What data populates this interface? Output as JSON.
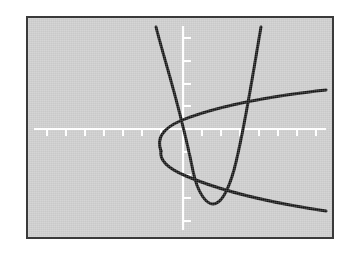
{
  "figure": {
    "kind": "graphing-calculator-plot",
    "background_color": "#c9c9c9",
    "border_color": "#3a3a3a",
    "axis_color": "#ffffff",
    "curve_color": "#141414",
    "curve_width": 3.0,
    "axis_width": 2.0,
    "tick_length": 7,
    "frame": {
      "x": 26,
      "y": 16,
      "width": 308,
      "height": 223
    }
  },
  "chart_data": {
    "type": "line",
    "title": "",
    "subtitle": "",
    "xlabel": "",
    "ylabel": "",
    "grid": false,
    "legend_position": "none",
    "axes": {
      "x_axis_pixel_y": 111,
      "y_axis_pixel_x": 155,
      "x_axis_visible": true,
      "y_axis_visible": true,
      "xlim": [
        -8.2,
        8.2
      ],
      "ylim": [
        -5.9,
        5.9
      ],
      "x_tick_spacing": 1,
      "y_tick_spacing": 1,
      "tick_labels_visible": false,
      "x_tick_pixels": [
        19,
        38,
        57,
        76,
        95,
        114,
        133,
        155,
        174,
        193,
        212,
        231,
        250,
        269,
        288
      ],
      "y_tick_pixels": [
        20,
        43,
        66,
        88,
        134,
        157,
        180,
        203
      ]
    },
    "series": [
      {
        "name": "upward-parabola",
        "type": "line",
        "shape": "parabola-opening-up",
        "color": "#141414",
        "vertex": {
          "x": 1.3,
          "y": -3.9
        },
        "points": [
          {
            "x": -1.45,
            "y": 5.6
          },
          {
            "x": -1.0,
            "y": 3.6
          },
          {
            "x": -0.5,
            "y": 1.5
          },
          {
            "x": 0.0,
            "y": -0.2
          },
          {
            "x": 0.5,
            "y": -1.9
          },
          {
            "x": 0.9,
            "y": -3.2
          },
          {
            "x": 1.3,
            "y": -3.9
          },
          {
            "x": 1.7,
            "y": -3.4
          },
          {
            "x": 2.1,
            "y": -2.1
          },
          {
            "x": 2.6,
            "y": 0.3
          },
          {
            "x": 3.1,
            "y": 2.6
          },
          {
            "x": 3.5,
            "y": 5.6
          }
        ]
      },
      {
        "name": "rightward-parabola",
        "type": "line",
        "shape": "parabola-opening-right",
        "color": "#141414",
        "vertex": {
          "x": -0.6,
          "y": -0.6
        },
        "points_upper": [
          {
            "x": -0.6,
            "y": -0.6
          },
          {
            "x": -0.3,
            "y": 0.2
          },
          {
            "x": 0.4,
            "y": 0.9
          },
          {
            "x": 1.6,
            "y": 1.5
          },
          {
            "x": 3.0,
            "y": 2.1
          },
          {
            "x": 4.6,
            "y": 2.6
          },
          {
            "x": 6.4,
            "y": 3.0
          },
          {
            "x": 7.9,
            "y": 3.3
          }
        ],
        "points_lower": [
          {
            "x": -0.6,
            "y": -0.6
          },
          {
            "x": -0.3,
            "y": -1.3
          },
          {
            "x": 0.4,
            "y": -1.9
          },
          {
            "x": 1.6,
            "y": -2.5
          },
          {
            "x": 3.0,
            "y": -3.0
          },
          {
            "x": 4.6,
            "y": -3.5
          },
          {
            "x": 6.4,
            "y": -3.9
          },
          {
            "x": 7.9,
            "y": -4.2
          }
        ]
      }
    ],
    "intersections": [
      {
        "x": -0.1,
        "y": 0.6
      },
      {
        "x": 0.2,
        "y": -1.6
      },
      {
        "x": 2.1,
        "y": -2.1
      },
      {
        "x": 2.8,
        "y": 2.0
      }
    ],
    "annotations": []
  }
}
